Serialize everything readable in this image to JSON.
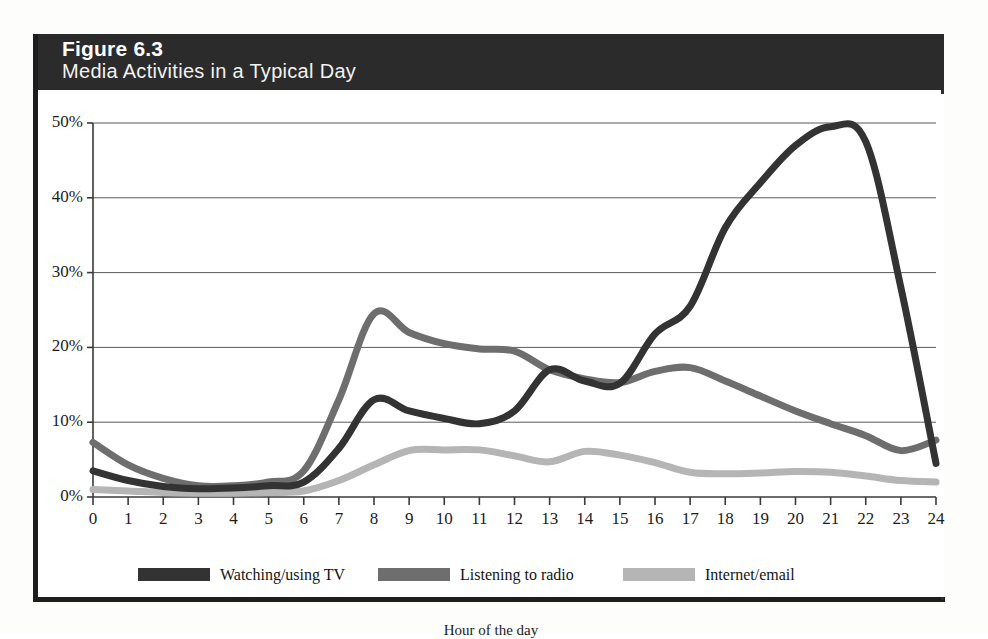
{
  "figure": {
    "number": "Figure 6.3",
    "title": "Media Activities in a Typical Day",
    "header_bg": "#2b2b2b",
    "header_text_color": "#ffffff"
  },
  "legend": {
    "position": "bottom",
    "items": [
      {
        "label": "Watching/using TV",
        "color": "#333333",
        "x": 100
      },
      {
        "label": "Listening to radio",
        "color": "#6e6e6e",
        "x": 340
      },
      {
        "label": "Internet/email",
        "color": "#b5b5b5",
        "x": 585
      }
    ]
  },
  "axes": {
    "y_ticks": [
      "0%",
      "10%",
      "20%",
      "30%",
      "40%",
      "50%"
    ],
    "x_ticks": [
      "0",
      "1",
      "2",
      "3",
      "4",
      "5",
      "6",
      "7",
      "8",
      "9",
      "10",
      "11",
      "12",
      "13",
      "14",
      "15",
      "16",
      "17",
      "18",
      "19",
      "20",
      "21",
      "22",
      "23",
      "24"
    ],
    "x_title": "Hour of the day"
  },
  "chart_data": {
    "type": "line",
    "title": "Media Activities in a Typical Day",
    "subtitle": "Figure 6.3",
    "xlabel": "Hour of the day",
    "ylabel": "",
    "xlim": [
      0,
      24
    ],
    "ylim": [
      0,
      50
    ],
    "ytick_values": [
      0,
      10,
      20,
      30,
      40,
      50
    ],
    "ytick_labels": [
      "0%",
      "10%",
      "20%",
      "30%",
      "40%",
      "50%"
    ],
    "xtick_values": [
      0,
      1,
      2,
      3,
      4,
      5,
      6,
      7,
      8,
      9,
      10,
      11,
      12,
      13,
      14,
      15,
      16,
      17,
      18,
      19,
      20,
      21,
      22,
      23,
      24
    ],
    "grid": "horizontal",
    "legend_position": "bottom",
    "units": "percent of population",
    "x": [
      0,
      1,
      2,
      3,
      4,
      5,
      6,
      7,
      8,
      9,
      10,
      11,
      12,
      13,
      14,
      15,
      16,
      17,
      18,
      19,
      20,
      21,
      22,
      23,
      24
    ],
    "series": [
      {
        "name": "Watching/using TV",
        "color": "#333333",
        "values": [
          3.5,
          2.2,
          1.4,
          1.1,
          1.2,
          1.5,
          2.0,
          6.5,
          13.0,
          11.5,
          10.5,
          9.8,
          11.5,
          17.0,
          15.5,
          15.2,
          21.8,
          25.5,
          36.0,
          42.0,
          47.0,
          49.5,
          47.5,
          28.0,
          4.5
        ],
        "notes": "Sharp step up just before hour 16; steep drop after hour 22"
      },
      {
        "name": "Listening to radio",
        "color": "#6e6e6e",
        "values": [
          7.3,
          4.3,
          2.5,
          1.5,
          1.5,
          2.0,
          3.5,
          13.0,
          24.5,
          22.0,
          20.5,
          19.8,
          19.5,
          17.0,
          15.8,
          15.3,
          16.8,
          17.3,
          15.5,
          13.5,
          11.5,
          9.8,
          8.2,
          6.2,
          7.6
        ]
      },
      {
        "name": "Internet/email",
        "color": "#b5b5b5",
        "values": [
          1.0,
          0.8,
          0.6,
          0.5,
          0.5,
          0.6,
          0.8,
          2.2,
          4.3,
          6.2,
          6.3,
          6.3,
          5.5,
          4.7,
          6.1,
          5.6,
          4.6,
          3.3,
          3.1,
          3.2,
          3.4,
          3.3,
          2.8,
          2.2,
          2.0
        ]
      }
    ]
  }
}
